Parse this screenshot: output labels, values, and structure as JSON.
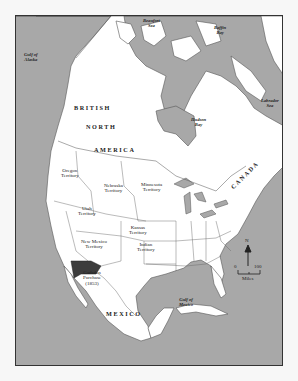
{
  "map": {
    "colors": {
      "water": "#a8a8a8",
      "land": "#ffffff",
      "gadsden": "#3c3c3c",
      "border": "#333333"
    },
    "water_labels": {
      "beaufort": "Beaufort\nSea",
      "baffin": "Baffin\nBay",
      "alaska": "Gulf of\nAlaska",
      "hudson": "Hudson\nBay",
      "labrador": "Labrador\nSea",
      "mexico_gulf": "Gulf of\nMexico"
    },
    "region_labels": {
      "british": "BRITISH",
      "north": "NORTH",
      "america": "AMERICA",
      "canada": "CANADA",
      "mexico": "MEXICO"
    },
    "territory_labels": {
      "oregon": "Oregon\nTerritory",
      "nebraska": "Nebraska\nTerritory",
      "minnesota": "Minnesota\nTerritory",
      "utah": "Utah\nTerritory",
      "kansas": "Kansas\nTerritory",
      "new_mexico": "New Mexico\nTerritory",
      "indian": "Indian\nTerritory",
      "gadsden": "Gadsden\nPurchase\n(1853)"
    },
    "compass": {
      "label": "N"
    },
    "scale": {
      "start": "0",
      "end": "100",
      "unit": "Miles"
    }
  }
}
